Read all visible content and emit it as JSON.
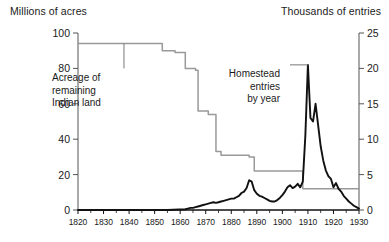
{
  "chart_data": {
    "type": "line",
    "title": "",
    "xlabel": "",
    "xlim": [
      1820,
      1930
    ],
    "xticks": [
      1820,
      1830,
      1840,
      1850,
      1860,
      1870,
      1880,
      1890,
      1900,
      1910,
      1920,
      1930
    ],
    "grid": false,
    "legend_position": "none",
    "axes": {
      "left": {
        "label": "Millions of acres",
        "lim": [
          0,
          100
        ],
        "ticks": [
          0,
          20,
          40,
          60,
          80,
          100
        ],
        "tick_labels": [
          "0",
          "20",
          "40",
          "60",
          "80",
          "100"
        ]
      },
      "right": {
        "label": "Thousands of entries",
        "lim": [
          0,
          25
        ],
        "ticks": [
          0,
          5,
          10,
          15,
          20,
          25
        ],
        "tick_labels": [
          "0",
          "5",
          "10",
          "15",
          "20",
          "25"
        ]
      }
    },
    "series": [
      {
        "name": "Acreage of remaining Indian land",
        "axis": "left",
        "color": "#999999",
        "style": "step",
        "x": [
          1820,
          1850,
          1853,
          1853,
          1858,
          1858,
          1862,
          1862,
          1866,
          1866,
          1867,
          1867,
          1871,
          1871,
          1874,
          1874,
          1876,
          1876,
          1887,
          1887,
          1889,
          1889,
          1908,
          1908,
          1930
        ],
        "values": [
          94,
          94,
          94,
          90,
          90,
          89,
          89,
          80,
          80,
          79,
          79,
          56,
          56,
          54,
          54,
          33,
          33,
          31,
          31,
          30,
          30,
          22,
          22,
          12,
          12
        ]
      },
      {
        "name": "Homestead entries by year",
        "axis": "right",
        "color": "#111111",
        "style": "line",
        "x": [
          1820,
          1840,
          1855,
          1862,
          1863,
          1864,
          1865,
          1866,
          1867,
          1868,
          1869,
          1870,
          1871,
          1872,
          1873,
          1874,
          1875,
          1876,
          1877,
          1878,
          1879,
          1880,
          1881,
          1882,
          1883,
          1884,
          1885,
          1886,
          1887,
          1888,
          1889,
          1890,
          1891,
          1892,
          1893,
          1894,
          1895,
          1896,
          1897,
          1898,
          1899,
          1900,
          1901,
          1902,
          1903,
          1904,
          1905,
          1906,
          1907,
          1908,
          1909,
          1910,
          1911,
          1912,
          1913,
          1914,
          1915,
          1916,
          1917,
          1918,
          1919,
          1920,
          1921,
          1922,
          1923,
          1924,
          1925,
          1926,
          1927,
          1928,
          1929,
          1930
        ],
        "values": [
          0,
          0,
          0,
          0.1,
          0.2,
          0.3,
          0.3,
          0.4,
          0.5,
          0.6,
          0.7,
          0.8,
          0.9,
          1.0,
          1.1,
          1.0,
          1.1,
          1.2,
          1.3,
          1.4,
          1.5,
          1.6,
          1.6,
          1.8,
          2.0,
          2.4,
          2.6,
          3.1,
          4.2,
          4.0,
          2.8,
          2.3,
          2.0,
          1.9,
          1.7,
          1.5,
          1.3,
          1.2,
          1.2,
          1.4,
          1.7,
          2.1,
          2.6,
          3.2,
          3.5,
          3.1,
          3.3,
          3.7,
          3.2,
          4.0,
          10.5,
          20.5,
          13.0,
          12.5,
          15.0,
          12.0,
          9.0,
          7.0,
          5.6,
          4.8,
          4.4,
          3.2,
          3.8,
          3.0,
          2.6,
          2.0,
          1.6,
          1.2,
          0.9,
          0.6,
          0.4,
          0.2
        ]
      }
    ],
    "annotations": [
      {
        "id": "indian-land",
        "lines": [
          "Acreage of",
          "remaining",
          "Indian land"
        ],
        "leader_from": [
          1838,
          80
        ],
        "leader_to": [
          1838,
          94
        ]
      },
      {
        "id": "homestead",
        "lines": [
          "Homestead",
          "entries",
          "by year"
        ],
        "leader_from": [
          1903,
          20.5
        ],
        "leader_to": [
          1910,
          20.5
        ]
      }
    ]
  }
}
